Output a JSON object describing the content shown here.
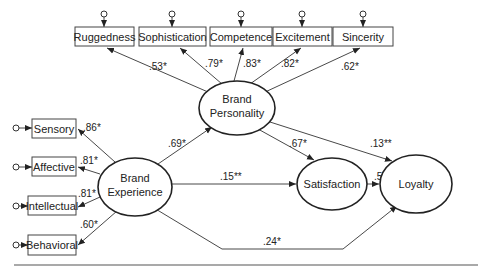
{
  "diagram": {
    "latent": {
      "brand_personality": [
        "Brand",
        "Personality"
      ],
      "brand_experience": [
        "Brand",
        "Experience"
      ],
      "satisfaction": "Satisfaction",
      "loyalty": "Loyalty"
    },
    "personality_indicators": [
      {
        "label": "Ruggedness",
        "loading": ".53*"
      },
      {
        "label": "Sophistication",
        "loading": ".79*"
      },
      {
        "label": "Competence",
        "loading": ".83*"
      },
      {
        "label": "Excitement",
        "loading": ".82*"
      },
      {
        "label": "Sincerity",
        "loading": ".62*"
      }
    ],
    "experience_indicators": [
      {
        "label": "Sensory",
        "loading": ".86*"
      },
      {
        "label": "Affective",
        "loading": ".81*"
      },
      {
        "label": "Intellectual",
        "loading": ".81*"
      },
      {
        "label": "Behavioral",
        "loading": ".60*"
      }
    ],
    "paths": {
      "experience_to_personality": ".69*",
      "personality_to_satisfaction": ".67*",
      "personality_to_loyalty": ".13**",
      "experience_to_satisfaction": ".15**",
      "satisfaction_to_loyalty": ".59*",
      "experience_to_loyalty": ".24*"
    }
  }
}
